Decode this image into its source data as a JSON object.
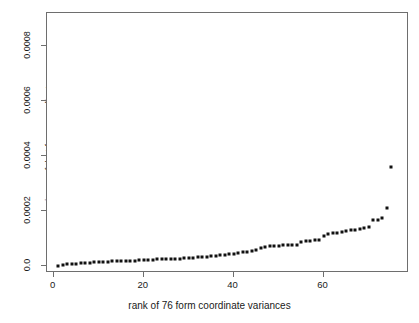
{
  "chart_data": {
    "type": "scatter",
    "title": "",
    "xlabel": "rank of 76 form coordinate variances",
    "ylabel": "variance of that form coordinate",
    "xlim": [
      -1.5,
      79
    ],
    "ylim": [
      -2.55e-05,
      0.000922
    ],
    "xticks": [
      0,
      20,
      40,
      60
    ],
    "xticklabels": [
      "0",
      "20",
      "40",
      "60"
    ],
    "yticks": [
      0,
      0.0002,
      0.0004,
      0.0006,
      0.0008
    ],
    "yticklabels": [
      "0.0",
      "0.0002",
      "0.0004",
      "0.0006",
      "0.0008"
    ],
    "grid": false,
    "legend_position": "top-right",
    "marker": "square",
    "marker_color": "#111111",
    "frame_color": "#6e6e6e",
    "background": "#ffffff",
    "legend": [
      {
        "label": "variance of ln CS",
        "marker": "square",
        "color": "#111111"
      },
      {
        "label": "variance of the single most variable shape coordinate",
        "marker": "square",
        "color": "#111111"
      }
    ],
    "series": [
      {
        "name": "variance of that form coordinate",
        "x": [
          1,
          2,
          3,
          4,
          5,
          6,
          7,
          8,
          9,
          10,
          11,
          12,
          13,
          14,
          15,
          16,
          17,
          18,
          19,
          20,
          21,
          22,
          23,
          24,
          25,
          26,
          27,
          28,
          29,
          30,
          31,
          32,
          33,
          34,
          35,
          36,
          37,
          38,
          39,
          40,
          41,
          42,
          43,
          44,
          45,
          46,
          47,
          48,
          49,
          50,
          51,
          52,
          53,
          54,
          55,
          56,
          57,
          58,
          59,
          60,
          61,
          62,
          63,
          64,
          65,
          66,
          67,
          68,
          69,
          70,
          71,
          72,
          73,
          74,
          75
        ],
        "y": [
          1.5e-06,
          4e-06,
          6e-06,
          7.5e-06,
          9e-06,
          1e-05,
          1.1e-05,
          1.2e-05,
          1.3e-05,
          1.4e-05,
          1.5e-05,
          1.6e-05,
          1.65e-05,
          1.72e-05,
          1.8e-05,
          1.88e-05,
          1.95e-05,
          2e-05,
          2.08e-05,
          2.15e-05,
          2.22e-05,
          2.3e-05,
          2.38e-05,
          2.45e-05,
          2.52e-05,
          2.58e-05,
          2.65e-05,
          2.72e-05,
          2.8e-05,
          2.88e-05,
          3e-05,
          3.15e-05,
          3.3e-05,
          3.45e-05,
          3.6e-05,
          3.78e-05,
          3.95e-05,
          4.15e-05,
          4.35e-05,
          4.55e-05,
          4.78e-05,
          5e-05,
          5.2e-05,
          5.45e-05,
          5.7e-05,
          6.4e-05,
          6.8e-05,
          7.15e-05,
          7.35e-05,
          7.45e-05,
          7.52e-05,
          7.58e-05,
          7.65e-05,
          7.75e-05,
          8.9e-05,
          9.1e-05,
          9.25e-05,
          9.35e-05,
          9.4e-05,
          0.000108,
          0.0001165,
          0.000119,
          0.0001215,
          0.000124,
          0.0001262,
          0.00013,
          0.0001325,
          0.0001355,
          0.0001385,
          0.0001415,
          0.000168,
          0.000169,
          0.000174,
          0.000211,
          0.000359
        ]
      }
    ],
    "annotations": [
      {
        "text": "top point is the variance of ln CS",
        "x": 75,
        "y": 0.000359
      }
    ]
  },
  "axis": {
    "y_title": "variance of that form coordinate",
    "x_title": "rank of 76 form coordinate variances"
  }
}
